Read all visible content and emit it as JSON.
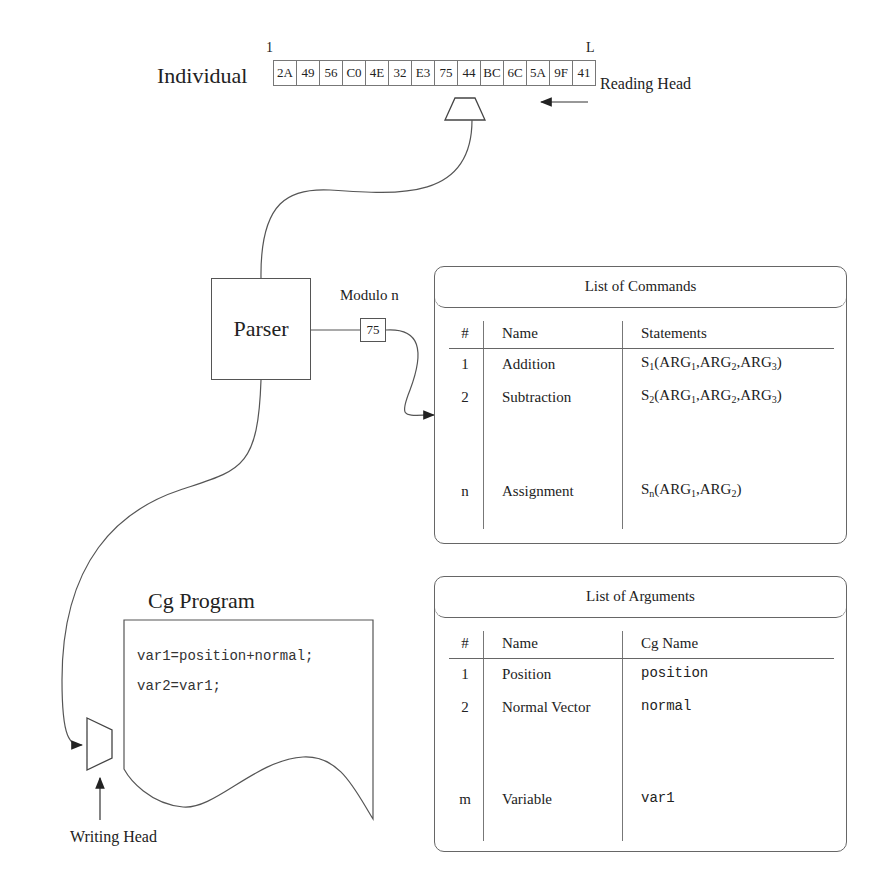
{
  "individual": {
    "label": "Individual",
    "index_first": "1",
    "index_last": "L",
    "genes": [
      "2A",
      "49",
      "56",
      "C0",
      "4E",
      "32",
      "E3",
      "75",
      "44",
      "BC",
      "6C",
      "5A",
      "9F",
      "41"
    ]
  },
  "reading_head": {
    "label": "Reading Head",
    "icon": "reading-head-trapezoid"
  },
  "parser": {
    "label": "Parser"
  },
  "modulo": {
    "label": "Modulo n",
    "value": "75"
  },
  "commands": {
    "title": "List of Commands",
    "headers": {
      "num": "#",
      "name": "Name",
      "value": "Statements"
    },
    "rows": [
      {
        "num": "1",
        "name": "Addition",
        "stmt": "S",
        "stmt_sub": "1",
        "args": [
          "ARG",
          "1",
          "ARG",
          "2",
          "ARG",
          "3"
        ]
      },
      {
        "num": "2",
        "name": "Subtraction",
        "stmt": "S",
        "stmt_sub": "2",
        "args": [
          "ARG",
          "1",
          "ARG",
          "2",
          "ARG",
          "3"
        ]
      },
      {
        "num": "n",
        "name": "Assignment",
        "stmt": "S",
        "stmt_sub": "n",
        "args": [
          "ARG",
          "1",
          "ARG",
          "2"
        ]
      }
    ]
  },
  "arguments": {
    "title": "List of Arguments",
    "headers": {
      "num": "#",
      "name": "Name",
      "value": "Cg Name"
    },
    "rows": [
      {
        "num": "1",
        "name": "Position",
        "cg": "position"
      },
      {
        "num": "2",
        "name": "Normal Vector",
        "cg": "normal"
      },
      {
        "num": "m",
        "name": "Variable",
        "cg": "var1"
      }
    ]
  },
  "cg_program": {
    "title": "Cg Program",
    "lines": [
      "var1=position+normal;",
      "var2=var1;"
    ]
  },
  "writing_head": {
    "label": "Writing Head",
    "icon": "writing-head-trapezoid"
  }
}
